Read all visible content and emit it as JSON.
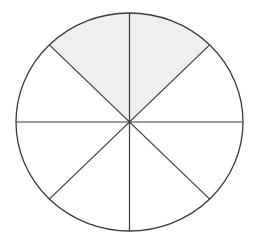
{
  "diagram": {
    "type": "fraction-circle",
    "total_parts": 8,
    "shaded_parts": 2,
    "shaded_sectors": [
      "top-left",
      "top-right"
    ],
    "fraction": "2/8",
    "colors": {
      "stroke": "#3a3a3a",
      "shade": "#efefef",
      "background": "#ffffff"
    }
  }
}
